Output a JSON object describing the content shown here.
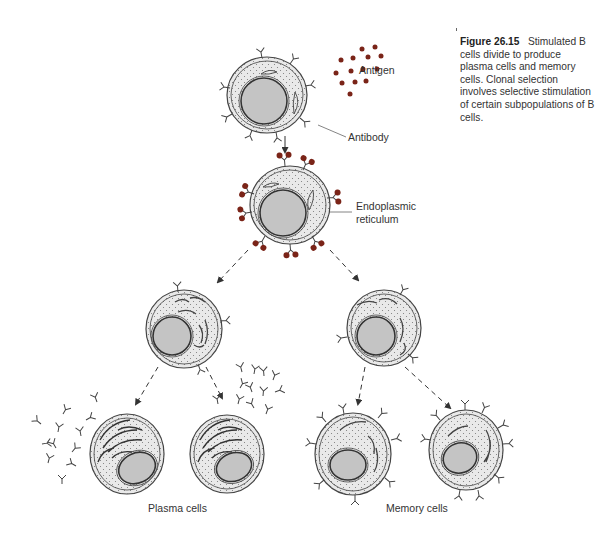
{
  "figure": {
    "number": "Figure 26.15",
    "caption": "Stimulated B cells divide to produce plasma cells and memory cells. Clonal selection involves selective stimulation of certain subpopulations of B cells."
  },
  "labels": {
    "antigen": "Antigen",
    "antibody": "Antibody",
    "er_line1": "Endoplasmic",
    "er_line2": "reticulum",
    "plasma_cells": "Plasma cells",
    "memory_cells": "Memory cells"
  },
  "colors": {
    "antigen_dot": "#7a2418",
    "nucleus": "#c4c4c4",
    "cytoplasm": "#e9e9e9",
    "outline": "#444444"
  }
}
